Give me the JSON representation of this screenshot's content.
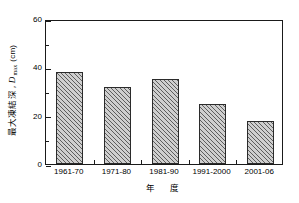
{
  "chart_data": {
    "type": "bar",
    "title": "",
    "categories": [
      "1961-70",
      "1971-80",
      "1981-90",
      "1991-2000",
      "2001-06"
    ],
    "values": [
      38,
      32,
      35,
      25,
      18
    ],
    "xlabel": "年　度",
    "ylabel_jp": "最大凍結深",
    "ylabel_symbol": "D",
    "ylabel_symbol_sub": "max",
    "ylabel_unit": "(cm)",
    "ylabel_separator": ",",
    "ylim": [
      0,
      60
    ],
    "xlim_note": "categorical",
    "ytick_labels": [
      "0",
      "20",
      "40",
      "60"
    ],
    "ytick_values": [
      0,
      20,
      40,
      60
    ],
    "yminor_values": [
      10,
      30,
      50
    ],
    "grid": false,
    "legend": "none",
    "bar_fill": "#cfcfcf",
    "bar_hatch": "diagonal-45",
    "bar_edge_color": "#2b2b2b",
    "axis_color": "#1a1a1a",
    "background": "#ffffff"
  }
}
